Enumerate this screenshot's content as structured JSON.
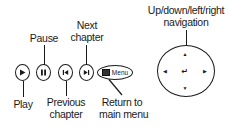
{
  "labels": {
    "next": [
      "Next",
      "chapter"
    ],
    "pause": "Pause",
    "play": "Play",
    "previous": [
      "Previous",
      "chapter"
    ],
    "return": [
      "Return to",
      "main menu"
    ],
    "navigation": [
      "Up/down/left/right",
      "navigation"
    ]
  },
  "buttons": {
    "play_icon": "play-icon",
    "pause_icon": "pause-icon",
    "previous_icon": "previous-chapter-icon",
    "next_icon": "next-chapter-icon",
    "menu_label": "Menu"
  },
  "navigation_pad": {
    "up": "▲",
    "down": "▼",
    "left": "◀",
    "right": "▶",
    "enter": "↵"
  }
}
